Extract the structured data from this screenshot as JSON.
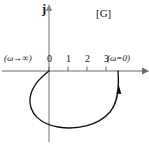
{
  "figure": {
    "plane_label": "[G]",
    "imaginary_axis_label": "j",
    "start_label": "(ω→∞)",
    "end_label": "(ω=0)",
    "axis_color": "#6b6b6b",
    "curve_color": "#111111",
    "text_color": "#111111",
    "background": "#ffffff"
  },
  "chart_data": {
    "type": "line",
    "title": "",
    "subtitle": "",
    "xlabel": "",
    "ylabel": "j",
    "plane_annotation": "[G]",
    "grid": false,
    "legend": null,
    "xlim": [
      -1,
      4.5
    ],
    "ylim": [
      -3.2,
      1.2
    ],
    "x_ticks": [
      0,
      1,
      2,
      3
    ],
    "x_tick_labels": [
      "0",
      "1",
      "2",
      "3"
    ],
    "y_ticks": [],
    "y_tick_labels": [],
    "annotations": [
      {
        "text": "(ω→∞)",
        "x": -0.9,
        "y": 0.55,
        "points_to": [
          0,
          0
        ]
      },
      {
        "text": "(ω=0)",
        "x": 3.1,
        "y": 0.55,
        "points_to": [
          3.55,
          0
        ]
      },
      {
        "text": "[G]",
        "x": 2.5,
        "y": 1.05
      },
      {
        "text": "j",
        "x": 0.0,
        "y": 1.15
      }
    ],
    "series": [
      {
        "name": "Nyquist locus",
        "direction": "from (ω→∞) at origin, clockwise-looping below the real axis, to (ω=0) at approximately 3.5",
        "arrow_at_fraction": 0.88,
        "x": [
          0.0,
          -0.38,
          -0.6,
          -0.62,
          -0.45,
          -0.1,
          0.45,
          1.05,
          1.65,
          2.2,
          2.7,
          3.1,
          3.38,
          3.52,
          3.55
        ],
        "y": [
          0.0,
          -0.22,
          -0.65,
          -1.2,
          -1.75,
          -2.25,
          -2.65,
          -2.85,
          -2.9,
          -2.78,
          -2.5,
          -2.05,
          -1.45,
          -0.75,
          0.0
        ]
      }
    ]
  }
}
